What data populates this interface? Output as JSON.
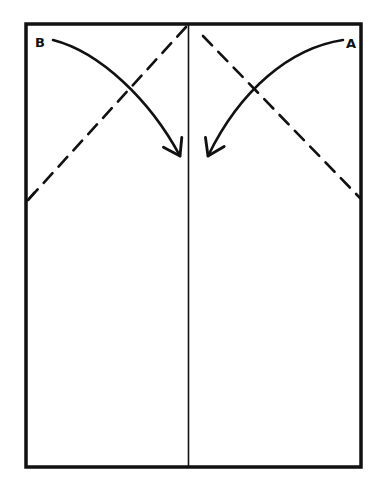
{
  "diagram": {
    "type": "folding-instructions",
    "colors": {
      "stroke": "#111111",
      "background": "#ffffff"
    },
    "labels": {
      "left_corner": "B",
      "right_corner": "A"
    },
    "elements": [
      {
        "kind": "rectangle-outline",
        "description": "paper sheet"
      },
      {
        "kind": "solid-line",
        "description": "vertical center crease"
      },
      {
        "kind": "dashed-line",
        "description": "left fold line from top-center to left edge"
      },
      {
        "kind": "dashed-line",
        "description": "right fold line from top-center to right edge"
      },
      {
        "kind": "curved-arrow",
        "description": "arrow from corner B folding to center"
      },
      {
        "kind": "curved-arrow",
        "description": "arrow from corner A folding to center"
      }
    ]
  }
}
